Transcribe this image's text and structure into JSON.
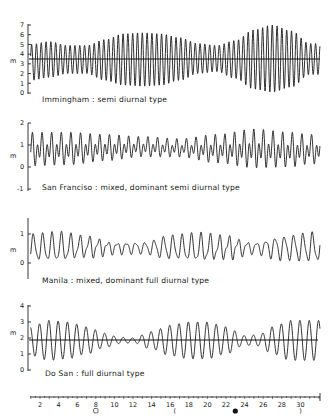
{
  "figure": {
    "x_axis": {
      "label": "day of month",
      "ticks": [
        "2",
        "4",
        "6",
        "8",
        "10",
        "12",
        "14",
        "16",
        "18",
        "20",
        "22",
        "24",
        "26",
        "28",
        "30"
      ],
      "moon_phase_symbols": [
        {
          "day": 8,
          "symbol": "first-quarter",
          "glyph": "○"
        },
        {
          "day": 16.5,
          "symbol": "full-moon-crescent",
          "glyph": "☾"
        },
        {
          "day": 23,
          "symbol": "new-moon",
          "glyph": "●"
        },
        {
          "day": 30,
          "symbol": "last-quarter",
          "glyph": "☽"
        }
      ]
    }
  },
  "panels": [
    {
      "id": "immingham",
      "label": "Immingham : semi diurnal type",
      "y_unit": "m",
      "y_ticks": [
        "0",
        "1",
        "2",
        "3",
        "4",
        "5",
        "6",
        "7"
      ]
    },
    {
      "id": "san-francisco",
      "label": "San Franciso : mixed, dominant semi diurnal type",
      "y_unit": "m",
      "y_ticks": [
        "-1",
        "0",
        "1",
        "2"
      ]
    },
    {
      "id": "manila",
      "label": "Manila : mixed, dominant full diurnal type",
      "y_unit": "m",
      "y_ticks": [
        "0",
        "1"
      ]
    },
    {
      "id": "do-san",
      "label": "Do San : full diurnal type",
      "y_unit": "m",
      "y_ticks": [
        "0",
        "1",
        "2",
        "3",
        "4"
      ]
    }
  ],
  "chart_data": [
    {
      "type": "line",
      "title": "Immingham : semi diurnal type",
      "xlabel": "day",
      "ylabel": "m",
      "ylim": [
        0,
        7
      ],
      "xlim": [
        1,
        32
      ],
      "mean_level": 3.4,
      "period_days": 0.5175,
      "range_envelope": {
        "days": [
          1,
          3,
          5,
          7,
          9,
          11,
          13,
          15,
          17,
          19,
          21,
          23,
          25,
          27,
          29,
          31
        ],
        "high": [
          5.0,
          5.3,
          4.9,
          4.9,
          5.5,
          6.1,
          6.2,
          6.1,
          5.7,
          5.1,
          4.9,
          5.4,
          6.5,
          7.0,
          6.4,
          5.1
        ],
        "low": [
          1.3,
          1.6,
          2.0,
          2.0,
          1.3,
          0.8,
          0.7,
          0.8,
          1.3,
          2.0,
          2.2,
          1.5,
          0.4,
          0.1,
          0.6,
          1.9
        ]
      }
    },
    {
      "type": "line",
      "title": "San Franciso : mixed, dominant semi diurnal type",
      "xlabel": "day",
      "ylabel": "m",
      "ylim": [
        -1,
        2
      ],
      "xlim": [
        1,
        32
      ],
      "components": "semi-diurnal dominant with diurnal inequality",
      "range_envelope": {
        "days": [
          1,
          5,
          9,
          13,
          17,
          21,
          25,
          29,
          31
        ],
        "high": [
          1.6,
          1.6,
          1.5,
          1.4,
          1.3,
          1.5,
          1.75,
          1.6,
          1.5
        ],
        "low": [
          -0.05,
          0.0,
          0.2,
          0.4,
          0.4,
          0.1,
          -0.15,
          -0.1,
          0.05
        ]
      }
    },
    {
      "type": "line",
      "title": "Manila : mixed, dominant full diurnal type",
      "xlabel": "day",
      "ylabel": "m",
      "ylim": [
        -0.5,
        1.5
      ],
      "xlim": [
        1,
        32
      ],
      "components": "diurnal dominant with semi-diurnal component",
      "range_envelope": {
        "days": [
          1,
          4,
          7,
          10,
          13,
          16,
          19,
          22,
          25,
          28,
          31
        ],
        "high": [
          1.05,
          1.1,
          0.95,
          0.75,
          0.75,
          1.0,
          1.05,
          0.95,
          0.75,
          1.0,
          1.1
        ],
        "low": [
          0.0,
          -0.05,
          0.15,
          0.3,
          0.3,
          0.05,
          -0.05,
          0.1,
          0.3,
          0.05,
          -0.05
        ]
      }
    },
    {
      "type": "line",
      "title": "Do San : full diurnal type",
      "xlabel": "day",
      "ylabel": "m",
      "ylim": [
        0,
        4
      ],
      "xlim": [
        1,
        32
      ],
      "mean_level": 1.85,
      "period_days": 1.0,
      "range_envelope": {
        "days": [
          1,
          3,
          5,
          7,
          9,
          10.5,
          12,
          14,
          16,
          18,
          20,
          22,
          24,
          25.5,
          27,
          29,
          31
        ],
        "high": [
          2.7,
          3.1,
          3.0,
          2.7,
          2.3,
          2.05,
          2.0,
          2.4,
          2.8,
          3.0,
          3.0,
          2.7,
          2.15,
          2.2,
          2.7,
          3.1,
          3.1
        ],
        "low": [
          0.9,
          0.6,
          0.7,
          1.0,
          1.4,
          1.65,
          1.7,
          1.3,
          0.9,
          0.7,
          0.7,
          1.0,
          1.55,
          1.5,
          1.0,
          0.6,
          0.6
        ]
      }
    }
  ]
}
